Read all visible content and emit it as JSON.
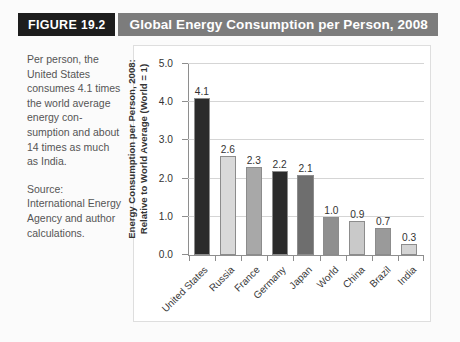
{
  "header": {
    "figure_word": "FIGURE",
    "figure_number": "19.2",
    "title": "Global Energy Consumption per Person, 2008"
  },
  "caption": {
    "body": "Per person, the United States consumes 4.1 times the world average energy con-sumption and about 14 times as much as India.",
    "source": "Source: International Energy Agency and author calculations."
  },
  "chart_data": {
    "type": "bar",
    "title": "Global Energy Consumption per Person, 2008",
    "xlabel": "",
    "ylabel": "Energy Consumption per Person, 2008:\nRelative to World Average (World = 1)",
    "categories": [
      "United States",
      "Russia",
      "France",
      "Germany",
      "Japan",
      "World",
      "China",
      "Brazil",
      "India"
    ],
    "values": [
      4.1,
      2.6,
      2.3,
      2.2,
      2.1,
      1.0,
      0.9,
      0.7,
      0.3
    ],
    "value_labels": [
      "4.1",
      "2.6",
      "2.3",
      "2.2",
      "2.1",
      "1.0",
      "0.9",
      "0.7",
      "0.3"
    ],
    "bar_colors": [
      "#2b2b2b",
      "#d9d9d9",
      "#a8a8a8",
      "#2b2b2b",
      "#6e6e6e",
      "#8f8f8f",
      "#c9c9c9",
      "#9a9a9a",
      "#d4d4d4"
    ],
    "ylim": [
      0.0,
      5.0
    ],
    "yticks": [
      0.0,
      1.0,
      2.0,
      3.0,
      4.0,
      5.0
    ],
    "ytick_labels": [
      "0.0",
      "1.0",
      "2.0",
      "3.0",
      "4.0",
      "5.0"
    ],
    "grid": true,
    "grid_axis": "y",
    "legend": false
  }
}
